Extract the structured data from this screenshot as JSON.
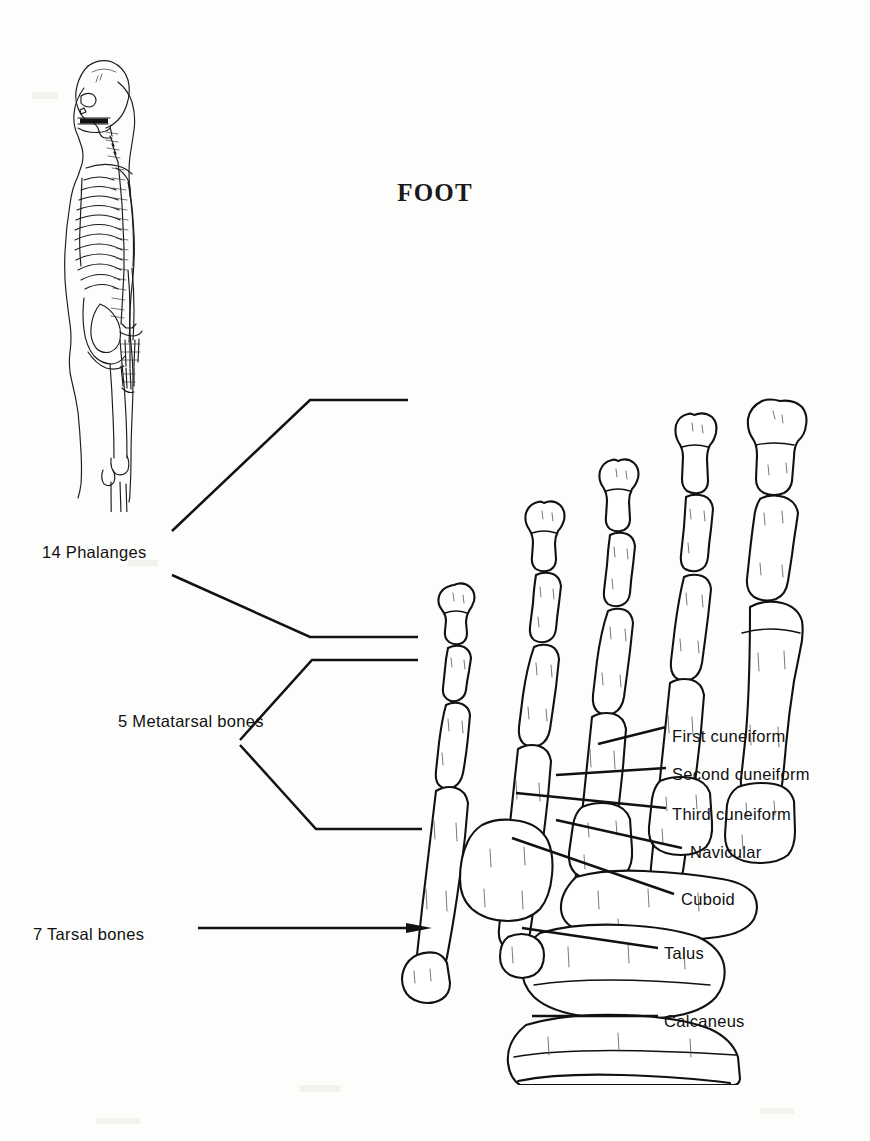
{
  "page": {
    "title": "FOOT",
    "width": 870,
    "height": 1141,
    "background_color": "#fdfdfc",
    "ink_color": "#111111"
  },
  "figures": {
    "skeleton": {
      "name": "lateral-skeleton-figure",
      "highlight_region": "foot",
      "highlight_color": "#0a0a0a"
    },
    "foot": {
      "name": "foot-bones-dorsal-view"
    }
  },
  "bracket_labels": [
    {
      "id": "phalanges",
      "text": "14 Phalanges",
      "count": 14,
      "x": 42,
      "y": 543
    },
    {
      "id": "metatarsals",
      "text": "5 Metatarsal bones",
      "count": 5,
      "x": 118,
      "y": 712
    },
    {
      "id": "tarsals",
      "text": "7 Tarsal bones",
      "count": 7,
      "x": 33,
      "y": 925
    }
  ],
  "callout_labels": [
    {
      "id": "first-cuneiform",
      "text": "First cuneiform",
      "x": 672,
      "y": 727
    },
    {
      "id": "second-cuneiform",
      "text": "Second cuneiform",
      "x": 672,
      "y": 765
    },
    {
      "id": "third-cuneiform",
      "text": "Third cuneiform",
      "x": 672,
      "y": 805
    },
    {
      "id": "navicular",
      "text": "Navicular",
      "x": 690,
      "y": 843
    },
    {
      "id": "cuboid",
      "text": "Cuboid",
      "x": 681,
      "y": 890
    },
    {
      "id": "talus",
      "text": "Talus",
      "x": 664,
      "y": 944
    },
    {
      "id": "calcaneus",
      "text": "Calcaneus",
      "x": 664,
      "y": 1012
    }
  ]
}
